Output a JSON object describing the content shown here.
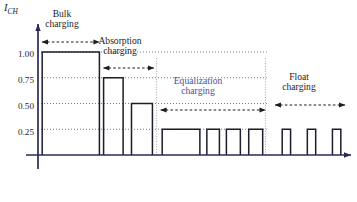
{
  "chart_data": {
    "type": "bar",
    "title": "",
    "xlabel": "",
    "ylabel": "I_CH",
    "ylabel_main": "I",
    "ylabel_sub": "CH",
    "ylim": [
      0,
      1.18
    ],
    "xlim": [
      0,
      100
    ],
    "grid": "horizontal dotted gridlines at each y tick",
    "legend": "none",
    "y_ticks": [
      {
        "value": 1.0,
        "label": "1.00"
      },
      {
        "value": 0.75,
        "label": "0.75"
      },
      {
        "value": 0.5,
        "label": "0.50"
      },
      {
        "value": 0.25,
        "label": "0.25"
      }
    ],
    "x_ticks": [],
    "series": [
      {
        "name": "Charging current",
        "pulses": [
          {
            "phase": "bulk",
            "x0": 1.5,
            "x1": 22.0,
            "value": 1.0
          },
          {
            "phase": "absorption",
            "x0": 23.5,
            "x1": 30.5,
            "value": 0.75
          },
          {
            "phase": "absorption",
            "x0": 33.5,
            "x1": 41.0,
            "value": 0.5
          },
          {
            "phase": "equalization",
            "x0": 44.5,
            "x1": 58.0,
            "value": 0.25
          },
          {
            "phase": "equalization",
            "x0": 60.5,
            "x1": 65.0,
            "value": 0.25
          },
          {
            "phase": "equalization",
            "x0": 67.5,
            "x1": 72.5,
            "value": 0.25
          },
          {
            "phase": "equalization",
            "x0": 75.5,
            "x1": 80.5,
            "value": 0.25
          },
          {
            "phase": "float",
            "x0": 87.5,
            "x1": 90.5,
            "value": 0.25
          },
          {
            "phase": "float",
            "x0": 96.5,
            "x1": 99.5,
            "value": 0.25
          },
          {
            "phase": "float",
            "x0": 105.5,
            "x1": 108.5,
            "value": 0.25
          }
        ]
      }
    ],
    "phase_dividers": [
      42.5,
      81.5
    ],
    "annotations": [
      {
        "id": "bulk",
        "label_line1": "Bulk",
        "label_line2": "charging",
        "arrow_start": 1.5,
        "arrow_end": 22.0,
        "accent": false
      },
      {
        "id": "absorption",
        "label_line1": "Absorption",
        "label_line2": "charging",
        "arrow_start": 23.5,
        "arrow_end": 41.5,
        "accent": false
      },
      {
        "id": "equalization",
        "label_line1": "Equalization",
        "label_line2": "charging",
        "arrow_start": 44.0,
        "arrow_end": 81.5,
        "accent": true
      },
      {
        "id": "float",
        "label_line1": "Float",
        "label_line2": "charging",
        "arrow_start": 85.0,
        "arrow_end": 110.0,
        "accent": false
      }
    ],
    "colors": {
      "bar_stroke": "#1d1d2b",
      "axis": "#2b2a55",
      "gridline": "#555555",
      "divider": "#9a9a9a",
      "annotation_arrow": "#1d1d1d",
      "accent_text": "#4a4ea8",
      "text": "#1d1d1d",
      "background": "#ffffff"
    }
  }
}
